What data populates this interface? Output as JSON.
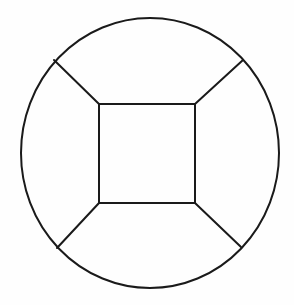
{
  "figure": {
    "title": "Circle with inscribed square and four radial spokes",
    "background_color": "#fefefe",
    "stroke_color": "#1a1a1a",
    "stroke_width": 2,
    "canvas": {
      "width": 294,
      "height": 305
    },
    "shapes": [
      {
        "name": "outer-circle",
        "type": "ellipse",
        "cx": 150,
        "cy": 153,
        "rx": 129,
        "ry": 135
      },
      {
        "name": "inner-square",
        "type": "rect",
        "x": 99,
        "y": 104,
        "width": 96,
        "height": 99
      }
    ],
    "spokes": [
      {
        "name": "spoke-top-left",
        "x1": 99,
        "y1": 104,
        "x2": 54,
        "y2": 60
      },
      {
        "name": "spoke-top-right",
        "x1": 195,
        "y1": 104,
        "x2": 243,
        "y2": 60
      },
      {
        "name": "spoke-bottom-left",
        "x1": 99,
        "y1": 203,
        "x2": 57,
        "y2": 248
      },
      {
        "name": "spoke-bottom-right",
        "x1": 195,
        "y1": 203,
        "x2": 241,
        "y2": 247
      }
    ],
    "regions": [
      {
        "name": "region-top",
        "label": ""
      },
      {
        "name": "region-right",
        "label": ""
      },
      {
        "name": "region-bottom",
        "label": ""
      },
      {
        "name": "region-left",
        "label": ""
      },
      {
        "name": "region-center",
        "label": ""
      }
    ]
  }
}
